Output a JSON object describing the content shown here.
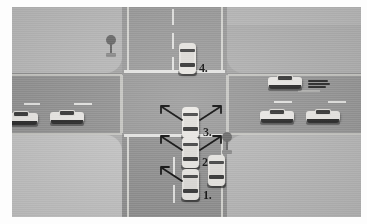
{
  "scene": {
    "title": "Four-way intersection traffic scenario",
    "description": "Aerial illustration of a four-way intersection with numbered vehicles and turn arrows",
    "colors": {
      "road": "#9a9a9a",
      "intersection": "#9d9d9d",
      "sidewalk": "#bdbdbd",
      "lane_marking": "#e8e8e6",
      "car_body": "#eceae6",
      "car_glass": "#3b3b3b",
      "callout_text": "#151515",
      "tree": "#6e6e6e",
      "frame": "#fdfdfd"
    }
  },
  "roads": {
    "vertical": {
      "name": "north-south-road",
      "center_line": "dashed"
    },
    "horizontal": {
      "name": "east-west-road",
      "center_line": "dashed"
    }
  },
  "callouts": [
    {
      "id": "callout-1",
      "label": "1.",
      "vehicle": "car-1"
    },
    {
      "id": "callout-2",
      "label": "2.",
      "vehicle": "car-2"
    },
    {
      "id": "callout-3",
      "label": "3.",
      "vehicle": "car-3"
    },
    {
      "id": "callout-4",
      "label": "4.",
      "vehicle": "car-4"
    }
  ],
  "vehicles": [
    {
      "id": "car-1",
      "name": "numbered-car-1",
      "orientation": "vertical",
      "lane": "northbound",
      "arrows": [
        "left"
      ]
    },
    {
      "id": "car-2",
      "name": "numbered-car-2",
      "orientation": "vertical",
      "lane": "northbound",
      "arrows": [
        "left",
        "right"
      ]
    },
    {
      "id": "car-3",
      "name": "numbered-car-3",
      "orientation": "vertical",
      "lane": "northbound",
      "arrows": [
        "left",
        "right"
      ]
    },
    {
      "id": "car-4",
      "name": "numbered-car-4",
      "orientation": "vertical",
      "lane": "southbound",
      "arrows": []
    },
    {
      "id": "car-side-1",
      "name": "adjacent-car-right-of-car-1",
      "orientation": "vertical",
      "lane": "adjacent",
      "arrows": []
    },
    {
      "id": "car-parked-left-1",
      "name": "parked-car-west-outer",
      "orientation": "horizontal",
      "lane": "westbound-shoulder",
      "arrows": []
    },
    {
      "id": "car-parked-left-2",
      "name": "parked-car-west-inner",
      "orientation": "horizontal",
      "lane": "westbound-shoulder",
      "arrows": []
    },
    {
      "id": "car-parked-right-1",
      "name": "parked-car-east-inner",
      "orientation": "horizontal",
      "lane": "eastbound-shoulder",
      "arrows": []
    },
    {
      "id": "car-parked-right-2",
      "name": "parked-car-east-outer",
      "orientation": "horizontal",
      "lane": "eastbound-shoulder",
      "arrows": []
    },
    {
      "id": "car-speeding",
      "name": "speeding-car-east",
      "orientation": "horizontal",
      "lane": "eastbound",
      "arrows": [],
      "motion_lines": true
    }
  ],
  "props": [
    {
      "id": "tree-northwest",
      "name": "tree-northwest"
    },
    {
      "id": "tree-center-right",
      "name": "tree-center-right"
    }
  ]
}
